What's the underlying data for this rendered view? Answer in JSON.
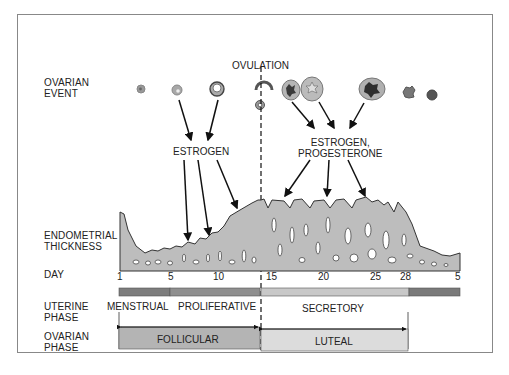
{
  "row_labels": {
    "ovarian_event": [
      "OVARIAN",
      "EVENT"
    ],
    "endometrial_thickness": [
      "ENDOMETRIAL",
      "THICKNESS"
    ],
    "day": "DAY",
    "uterine_phase": [
      "UTERINE",
      "PHASE"
    ],
    "ovarian_phase": [
      "OVARIAN",
      "PHASE"
    ]
  },
  "annotations": {
    "ovulation": "OVULATION",
    "estrogen": "ESTROGEN",
    "estrogen_progesterone": [
      "ESTROGEN,",
      "PROGESTERONE"
    ]
  },
  "day_ticks": [
    {
      "label": "1",
      "x": 119
    },
    {
      "label": "5",
      "x": 170
    },
    {
      "label": "10",
      "x": 218
    },
    {
      "label": "15",
      "x": 271
    },
    {
      "label": "20",
      "x": 324
    },
    {
      "label": "25",
      "x": 376
    },
    {
      "label": "28",
      "x": 405
    },
    {
      "label": "5",
      "x": 457
    }
  ],
  "uterine_phases": [
    {
      "label": "MENSTRUAL",
      "color": "#7d7d7d"
    },
    {
      "label": "PROLIFERATIVE",
      "color": "#8f8f8f"
    },
    {
      "label": "SECRETORY",
      "color": "#c8c8c8"
    },
    {
      "label": "",
      "color": "#7a7a7a"
    }
  ],
  "ovarian_phases": [
    {
      "label": "FOLLICULAR",
      "color": "#b4b4b4"
    },
    {
      "label": "LUTEAL",
      "color": "#dcdcdc"
    }
  ],
  "colors": {
    "tissue": "#bdbdbd",
    "tissue_outline": "#3a3a3a",
    "border": "#888888"
  }
}
